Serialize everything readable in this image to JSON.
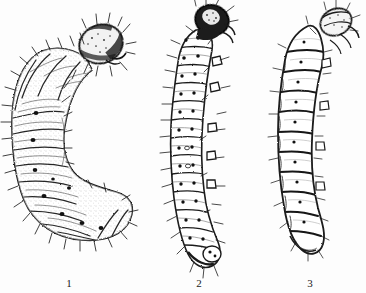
{
  "plate": {
    "title": "Comparative plate of three lepidopteran larvae",
    "background_color": "#fdfdfd",
    "ink_color": "#1a1a1a",
    "body_fill": "#ffffff",
    "width_px": 366,
    "height_px": 293,
    "style": "black-and-white stippled pen-and-ink scientific line drawing"
  },
  "figures": [
    {
      "label": "1",
      "name": "larva-1",
      "description": "Stout C-curved grub with heavily bristled body, large dark sclerotized head capsule at upper right, crumpled wrinkled segments and a broad rounded abdomen",
      "posture": "strongly curved, C-shaped",
      "head_shade": "dark",
      "segment_count": 12,
      "spiracle_count": 9,
      "bristles": "dense",
      "caption": "1"
    },
    {
      "label": "2",
      "name": "larva-2",
      "description": "Slender elongate caterpillar, gently S-curved, with very dark round head capsule at top, clearly separated swollen segments, paired pinacula spots and long scattered setae",
      "posture": "slightly curved, elongate",
      "head_shade": "very dark",
      "segment_count": 13,
      "spiracle_count": 12,
      "bristles": "sparse long setae",
      "caption": "2"
    },
    {
      "label": "3",
      "name": "larva-3",
      "description": "Smooth elongate larva with bold transverse segment divisions, pale body, small light head capsule tilted at top right, single mid-segment spiracle dots and tapering tail",
      "posture": "nearly straight, slight curve",
      "head_shade": "light",
      "segment_count": 13,
      "spiracle_count": 10,
      "bristles": "very few",
      "caption": "3"
    }
  ]
}
